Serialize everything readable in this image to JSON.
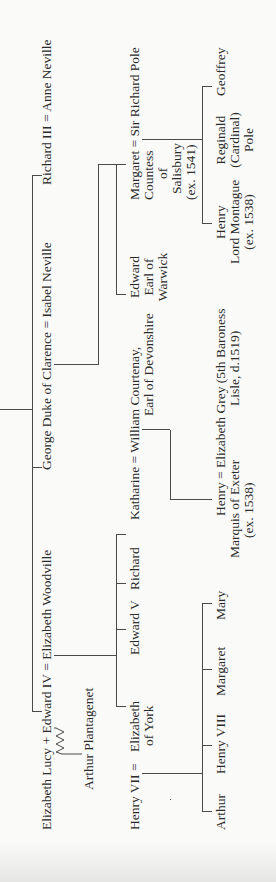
{
  "tree": {
    "row1": {
      "edward_iv_union": "Elizabeth Lucy + Edward IV = Elizabeth Woodville",
      "george_union": "George Duke of Clarence = Isabel Neville",
      "richard_iii_union": "Richard III = Anne Neville",
      "illegitimate_child": "Arthur Plantagenet"
    },
    "row2": {
      "henry_vii": "Henry VII =",
      "elizabeth_of_york_1": "Elizabeth",
      "elizabeth_of_york_2": "of York",
      "edward_v": "Edward V",
      "richard": "Richard",
      "katharine_union": "Katharine = William Courtenay,",
      "courtenay_title": "Earl of Devonshire",
      "edward_warwick_1": "Edward",
      "edward_warwick_2": "Earl of",
      "edward_warwick_3": "Warwick",
      "margaret_union": "Margaret = Sir Richard Pole",
      "margaret_2": "Countess",
      "margaret_3": "of",
      "margaret_4": "Salisbury",
      "margaret_5": "(ex. 1541)"
    },
    "row3": {
      "arthur": "Arthur",
      "henry_viii": "Henry VIII",
      "margaret": "Margaret",
      "mary": "Mary",
      "henry_exeter_union": "Henry = Elizabeth Grey (5th Baroness",
      "henry_exeter_2": "Marquis of Exeter",
      "henry_exeter_3": "(ex. 1538)",
      "grey_2": "Lisle, d.1519)",
      "henry_montague_1": "Henry",
      "henry_montague_2": "Lord Montague",
      "henry_montague_3": "(ex. 1538)",
      "reginald_1": "Reginald",
      "reginald_2": "(Cardinal)",
      "reginald_3": "Pole",
      "geoffrey": "Geoffrey"
    }
  }
}
